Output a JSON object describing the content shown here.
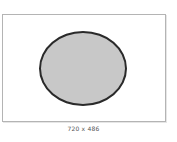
{
  "image": {
    "shape": "ellipse",
    "fill_color": "#c8c8c8",
    "stroke_color": "#2a2a2a",
    "frame_border_color": "#b4b4b4"
  },
  "caption": {
    "dimensions_label": "720 x 486"
  }
}
